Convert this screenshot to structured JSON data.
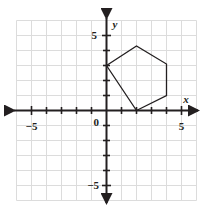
{
  "figure": {
    "background_color": "#ffffff"
  },
  "chart_data": {
    "type": "scatter",
    "title": "",
    "xlabel": "x",
    "ylabel": "y",
    "xlim": [
      -6,
      6
    ],
    "ylim": [
      -6,
      6
    ],
    "grid": true,
    "grid_step": 1,
    "grid_color": "#d9d9d9",
    "axis_color": "#231f20",
    "shape_color": "#231f20",
    "legend": "none",
    "x_tick_labels": [
      {
        "value": -5,
        "text": "−5"
      },
      {
        "value": 5,
        "text": "5"
      }
    ],
    "y_tick_labels": [
      {
        "value": 5,
        "text": "5"
      },
      {
        "value": -5,
        "text": "−5"
      }
    ],
    "origin_label": "0",
    "x_axis_label": "x",
    "y_axis_label": "y",
    "shapes": [
      {
        "name": "hexagon",
        "closed": true,
        "fill": "none",
        "stroke": "#231f20",
        "vertices": [
          {
            "x": 0,
            "y": 3
          },
          {
            "x": 2,
            "y": 4.3
          },
          {
            "x": 4,
            "y": 3.1
          },
          {
            "x": 4,
            "y": 1
          },
          {
            "x": 2,
            "y": 0
          }
        ]
      }
    ]
  }
}
